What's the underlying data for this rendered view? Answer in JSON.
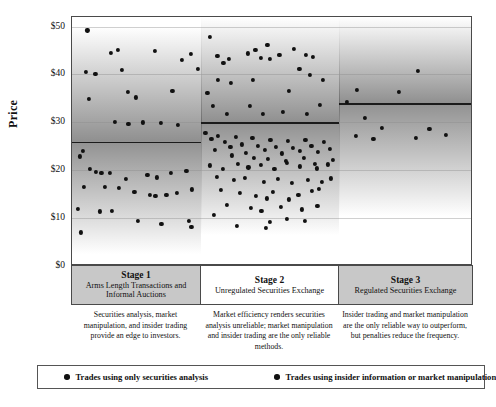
{
  "chart_data": {
    "type": "scatter",
    "title": "",
    "xlabel": "",
    "ylabel": "Price",
    "ylim": [
      0,
      52
    ],
    "grid": true,
    "y_ticks": [
      "$0",
      "$10",
      "$20",
      "$30",
      "$40",
      "$50"
    ],
    "y_tick_values": [
      0,
      10,
      20,
      30,
      40,
      50
    ],
    "legend_position": "bottom",
    "legend": [
      "Trades using only securities analysis",
      "Trades using insider information or market manipulation"
    ],
    "stages": [
      {
        "id": "stage-1",
        "title": "Stage 1",
        "subtitle": "Arms Length Transactions and Informal Auctions",
        "caption": "Securities analysis, market manipulation, and insider trading provide an edge to investors.",
        "shaded": true,
        "band_value": 26,
        "x_range": [
          0,
          32
        ],
        "series": [
          {
            "name": "Trades using only securities analysis",
            "points": [
              [
                3.8,
                49.2
              ],
              [
                3.4,
                40.6
              ],
              [
                5.8,
                40.1
              ],
              [
                4.1,
                34.9
              ],
              [
                2.7,
                24.1
              ],
              [
                9.6,
                44.5
              ],
              [
                11.3,
                45.2
              ],
              [
                13.8,
                36.4
              ],
              [
                15.9,
                35.2
              ],
              [
                12.4,
                41.0
              ],
              [
                20.6,
                45.0
              ],
              [
                24.9,
                36.5
              ],
              [
                27.2,
                43.0
              ],
              [
                29.5,
                44.3
              ],
              [
                31.2,
                41.2
              ],
              [
                10.7,
                30.1
              ],
              [
                14.0,
                29.6
              ],
              [
                17.6,
                30.0
              ],
              [
                22.0,
                29.8
              ],
              [
                26.2,
                29.4
              ],
              [
                1.9,
                22.9
              ],
              [
                4.5,
                20.3
              ],
              [
                5.9,
                19.7
              ],
              [
                7.3,
                19.5
              ],
              [
                9.5,
                19.4
              ],
              [
                13.3,
                18.2
              ],
              [
                18.7,
                19.1
              ],
              [
                21.0,
                18.5
              ],
              [
                24.6,
                19.4
              ],
              [
                28.4,
                19.9
              ],
              [
                3.0,
                16.5
              ],
              [
                8.2,
                16.6
              ],
              [
                11.7,
                16.3
              ],
              [
                15.5,
                15.5
              ],
              [
                19.4,
                14.8
              ],
              [
                20.7,
                14.6
              ],
              [
                23.4,
                14.9
              ],
              [
                26.0,
                15.2
              ],
              [
                29.8,
                16.0
              ],
              [
                1.5,
                11.9
              ],
              [
                6.9,
                11.4
              ],
              [
                9.8,
                11.5
              ],
              [
                16.3,
                9.4
              ],
              [
                22.2,
                8.8
              ],
              [
                28.9,
                9.5
              ],
              [
                29.6,
                8.2
              ],
              [
                2.2,
                7.0
              ]
            ]
          },
          {
            "name": "Trades using insider information or market manipulation",
            "points": []
          }
        ]
      },
      {
        "id": "stage-2",
        "title": "Stage 2",
        "subtitle": "Unregulated Securities Exchange",
        "caption": "Market efficiency renders securities analysis unreliable; market manipulation and insider trading are the only reliable methods.",
        "shaded": false,
        "band_value": 30,
        "x_range": [
          0,
          32
        ],
        "series": [
          {
            "name": "Trades using only securities analysis",
            "points": [
              [
                2.0,
                47.8
              ],
              [
                3.8,
                43.9
              ],
              [
                6.5,
                43.2
              ],
              [
                5.2,
                42.4
              ],
              [
                4.0,
                38.8
              ],
              [
                1.5,
                36.2
              ],
              [
                7.0,
                38.3
              ],
              [
                2.8,
                33.5
              ],
              [
                6.1,
                31.8
              ],
              [
                12.6,
                45.2
              ],
              [
                15.4,
                46.2
              ],
              [
                13.8,
                43.5
              ],
              [
                16.0,
                43.3
              ],
              [
                18.2,
                44.0
              ],
              [
                10.9,
                44.4
              ],
              [
                12.0,
                38.9
              ],
              [
                11.4,
                33.5
              ],
              [
                14.3,
                31.7
              ],
              [
                21.5,
                45.4
              ],
              [
                24.4,
                44.0
              ],
              [
                26.0,
                43.6
              ],
              [
                22.8,
                41.2
              ],
              [
                25.3,
                39.9
              ],
              [
                28.2,
                38.8
              ],
              [
                20.4,
                36.5
              ],
              [
                27.6,
                33.6
              ],
              [
                18.9,
                32.2
              ],
              [
                24.6,
                31.8
              ]
            ]
          },
          {
            "name": "Trades using insider information or market manipulation",
            "points": [
              [
                1.0,
                27.8
              ],
              [
                2.4,
                26.5
              ],
              [
                4.0,
                27.2
              ],
              [
                5.6,
                25.9
              ],
              [
                3.2,
                24.3
              ],
              [
                6.8,
                24.8
              ],
              [
                8.0,
                27.0
              ],
              [
                9.4,
                25.4
              ],
              [
                7.2,
                23.1
              ],
              [
                10.5,
                23.7
              ],
              [
                11.9,
                26.8
              ],
              [
                13.2,
                25.1
              ],
              [
                12.3,
                22.6
              ],
              [
                14.8,
                24.2
              ],
              [
                16.1,
                26.3
              ],
              [
                17.4,
                24.9
              ],
              [
                15.6,
                22.3
              ],
              [
                18.8,
                23.5
              ],
              [
                20.1,
                26.1
              ],
              [
                21.4,
                24.6
              ],
              [
                19.6,
                22.0
              ],
              [
                22.9,
                24.0
              ],
              [
                24.2,
                26.4
              ],
              [
                25.6,
                25.0
              ],
              [
                23.8,
                22.5
              ],
              [
                27.1,
                23.9
              ],
              [
                28.5,
                26.0
              ],
              [
                29.8,
                24.5
              ],
              [
                30.6,
                22.2
              ],
              [
                26.4,
                21.3
              ],
              [
                2.0,
                21.0
              ],
              [
                5.0,
                20.2
              ],
              [
                8.6,
                21.4
              ],
              [
                11.0,
                20.6
              ],
              [
                13.9,
                21.1
              ],
              [
                17.0,
                20.3
              ],
              [
                19.9,
                21.5
              ],
              [
                23.0,
                20.8
              ],
              [
                26.9,
                20.4
              ],
              [
                29.4,
                21.2
              ],
              [
                3.6,
                18.6
              ],
              [
                7.6,
                17.9
              ],
              [
                10.2,
                18.4
              ],
              [
                14.5,
                17.6
              ],
              [
                17.9,
                18.2
              ],
              [
                21.1,
                17.3
              ],
              [
                24.8,
                18.0
              ],
              [
                28.0,
                17.5
              ],
              [
                30.2,
                18.3
              ],
              [
                4.6,
                15.9
              ],
              [
                9.0,
                15.2
              ],
              [
                12.8,
                14.6
              ],
              [
                15.2,
                14.1
              ],
              [
                16.6,
                15.4
              ],
              [
                20.4,
                13.9
              ],
              [
                22.6,
                14.8
              ],
              [
                25.8,
                15.6
              ],
              [
                27.4,
                16.1
              ],
              [
                6.0,
                12.8
              ],
              [
                11.6,
                12.1
              ],
              [
                14.0,
                11.5
              ],
              [
                18.5,
                12.3
              ],
              [
                23.4,
                11.8
              ],
              [
                27.0,
                12.6
              ],
              [
                3.0,
                10.6
              ],
              [
                16.0,
                9.2
              ],
              [
                20.0,
                9.8
              ],
              [
                24.0,
                9.4
              ],
              [
                8.3,
                8.4
              ],
              [
                15.0,
                7.9
              ]
            ]
          }
        ]
      },
      {
        "id": "stage-3",
        "title": "Stage 3",
        "subtitle": "Regulated Securities Exchange",
        "caption": "Insider trading and market manipulation are the only reliable way to outperform, but penalties reduce the frequency.",
        "shaded": true,
        "band_value": 34,
        "x_range": [
          0,
          32
        ],
        "series": [
          {
            "name": "Trades using only securities analysis",
            "points": [
              [
                18.8,
                40.8
              ],
              [
                4.2,
                36.8
              ],
              [
                14.4,
                36.4
              ],
              [
                1.8,
                34.2
              ]
            ]
          },
          {
            "name": "Trades using insider information or market manipulation",
            "points": [
              [
                6.2,
                31.0
              ],
              [
                10.2,
                28.8
              ],
              [
                21.6,
                28.7
              ],
              [
                4.0,
                27.2
              ],
              [
                8.2,
                26.5
              ],
              [
                18.4,
                26.8
              ],
              [
                25.6,
                27.4
              ]
            ]
          }
        ]
      }
    ]
  }
}
